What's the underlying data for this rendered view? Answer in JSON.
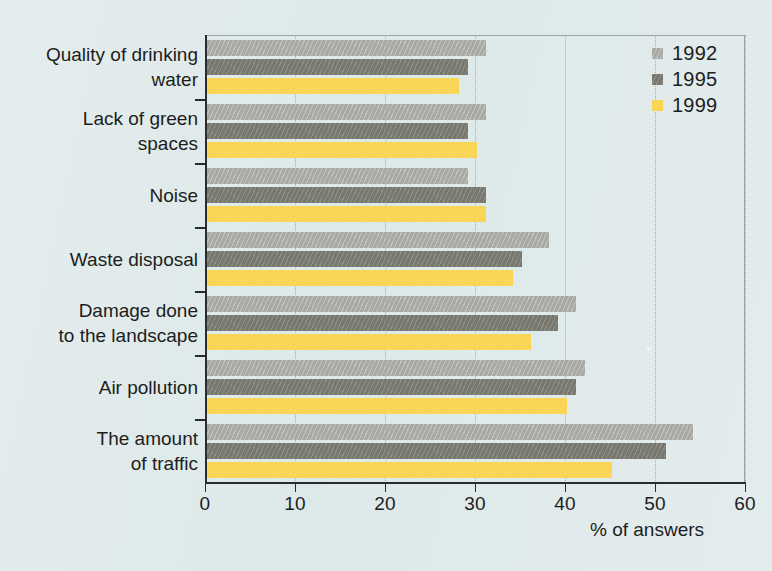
{
  "chart_data": {
    "type": "bar",
    "orientation": "horizontal",
    "title": "",
    "xlabel": "% of answers",
    "ylabel": "",
    "xlim": [
      0,
      60
    ],
    "xticks": [
      0,
      10,
      20,
      30,
      40,
      50,
      60
    ],
    "grid": "vertical dotted gridlines at each x tick",
    "legend_position": "top-right inside plot",
    "categories": [
      "Quality of drinking\nwater",
      "Lack of green\nspaces",
      "Noise",
      "Waste disposal",
      "Damage done\nto the landscape",
      "Air pollution",
      "The amount\nof traffic"
    ],
    "series": [
      {
        "name": "1992",
        "color": "#a9a9a4",
        "values": [
          31,
          31,
          29,
          38,
          41,
          42,
          54
        ]
      },
      {
        "name": "1995",
        "color": "#78786f",
        "values": [
          29,
          29,
          31,
          35,
          39,
          41,
          51
        ]
      },
      {
        "name": "1999",
        "color": "#fad453",
        "values": [
          28,
          30,
          31,
          34,
          36,
          40,
          45
        ]
      }
    ]
  },
  "legend": {
    "entries": [
      {
        "label": "1992"
      },
      {
        "label": "1995"
      },
      {
        "label": "1999"
      }
    ]
  },
  "axis": {
    "x_title": "% of answers",
    "x_tick_labels": [
      "0",
      "10",
      "20",
      "30",
      "40",
      "50",
      "60"
    ]
  },
  "colors": {
    "background": "#dfeaea",
    "axis": "#2b2b2b",
    "grid": "#9fb0b2",
    "series_1992": "#a9a9a4",
    "series_1995": "#78786f",
    "series_1999": "#fad453",
    "text": "#1d1d1d"
  }
}
